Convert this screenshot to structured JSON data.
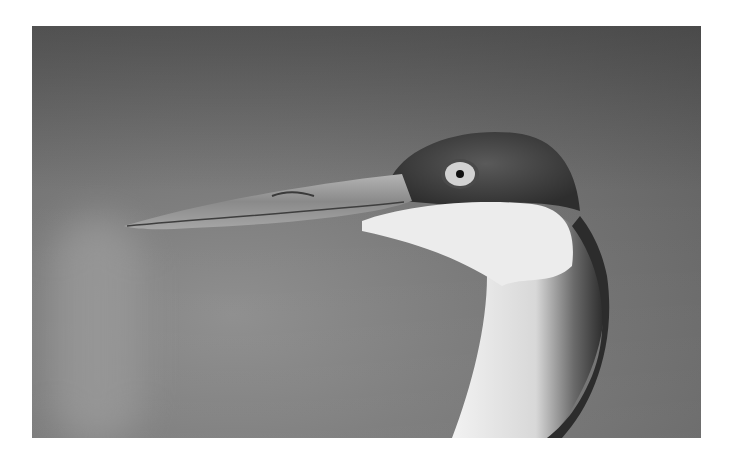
{
  "image": {
    "subject": "Grayscale close-up of a crane's head and neck in profile",
    "description": "Bird facing left with a long pointed beak, pale eye with dark pupil, dark textured crown, white cheek and throat, and curved neck with a dark stripe on the back",
    "palette": {
      "background_dark": "#5c5c5c",
      "background_light": "#8d8d8d",
      "crown": "#3a3a3a",
      "beak": "#9c9c9c",
      "cheek": "#ededed",
      "neck_stripe": "#2a2a2a",
      "page": "#ffffff"
    }
  }
}
